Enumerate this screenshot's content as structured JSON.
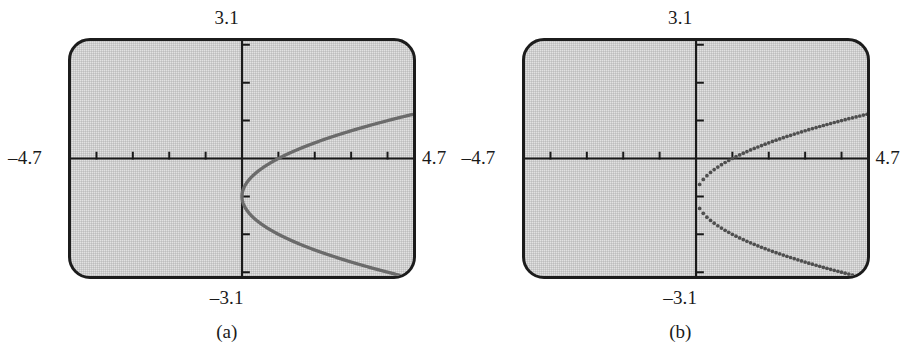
{
  "figure": {
    "panels": [
      {
        "caption": "(a)",
        "mode": "connected",
        "labels": {
          "ymax": "3.1",
          "ymin": "–3.1",
          "xmin": "–4.7",
          "xmax": "4.7"
        }
      },
      {
        "caption": "(b)",
        "mode": "dot",
        "labels": {
          "ymax": "3.1",
          "ymin": "–3.1",
          "xmin": "–4.7",
          "xmax": "4.7"
        }
      }
    ]
  },
  "colors": {
    "bezel": "#1c1c1c",
    "screen_fill": "#e2e2e2",
    "axis": "#1a1a1a",
    "curve": "#6b6b6b",
    "text": "#1a1a1a"
  },
  "chart_data": [
    {
      "type": "line",
      "title": "(a)",
      "xlabel": "",
      "ylabel": "",
      "xlim": [
        -4.7,
        4.7
      ],
      "ylim": [
        -3.1,
        3.1
      ],
      "grid": false,
      "legend": null,
      "axis_ticks": {
        "x_tick_values": [
          -4,
          -3,
          -2,
          -1,
          1,
          2,
          3,
          4
        ],
        "y_tick_values": [
          -3,
          -2,
          -1,
          1,
          2,
          3
        ],
        "x_tick_labels_shown": false,
        "y_tick_labels_shown": false
      },
      "annotations": [
        {
          "text": "3.1",
          "position": "above-screen-center"
        },
        {
          "text": "–3.1",
          "position": "below-screen-center"
        },
        {
          "text": "–4.7",
          "position": "left-of-screen-middle"
        },
        {
          "text": "4.7",
          "position": "right-of-screen-middle"
        }
      ],
      "description": "Sideways parabola x = (y+1)^2 - 0.02 drawn in connected line mode, vertex near (0, -1), opening to the right.",
      "series": [
        {
          "name": "upper branch",
          "x": [
            0.0,
            0.05,
            0.2,
            0.45,
            0.8,
            1.25,
            1.8,
            2.45,
            3.2,
            4.05,
            4.5
          ],
          "y": [
            -1.0,
            -0.78,
            -0.55,
            -0.33,
            -0.11,
            0.12,
            0.34,
            0.57,
            0.79,
            1.01,
            1.12
          ]
        },
        {
          "name": "lower branch",
          "x": [
            0.0,
            0.05,
            0.2,
            0.45,
            0.8,
            1.25,
            1.8,
            2.45,
            3.2,
            4.05,
            4.5
          ],
          "y": [
            -1.0,
            -1.22,
            -1.45,
            -1.67,
            -1.89,
            -2.12,
            -2.34,
            -2.57,
            -2.79,
            -3.01,
            -3.12
          ]
        }
      ]
    },
    {
      "type": "scatter",
      "title": "(b)",
      "xlabel": "",
      "ylabel": "",
      "xlim": [
        -4.7,
        4.7
      ],
      "ylim": [
        -3.1,
        3.1
      ],
      "grid": false,
      "legend": null,
      "axis_ticks": {
        "x_tick_values": [
          -4,
          -3,
          -2,
          -1,
          1,
          2,
          3,
          4
        ],
        "y_tick_values": [
          -3,
          -2,
          -1,
          1,
          2,
          3
        ],
        "x_tick_labels_shown": false,
        "y_tick_labels_shown": false
      },
      "annotations": [
        {
          "text": "3.1",
          "position": "above-screen-center"
        },
        {
          "text": "–3.1",
          "position": "below-screen-center"
        },
        {
          "text": "–4.7",
          "position": "left-of-screen-middle"
        },
        {
          "text": "4.7",
          "position": "right-of-screen-middle"
        }
      ],
      "description": "Same sideways parabola plotted in dot mode, showing discrete plotted points that become widely spaced far from the vertex.",
      "series": [
        {
          "name": "upper branch dots",
          "x": [
            0.0,
            0.02,
            0.09,
            0.2,
            0.36,
            0.56,
            0.81,
            1.1,
            1.44,
            1.82,
            2.25,
            2.72,
            3.24,
            3.8,
            4.41
          ],
          "y": [
            -1.0,
            -0.85,
            -0.7,
            -0.55,
            -0.4,
            -0.25,
            -0.1,
            0.05,
            0.2,
            0.35,
            0.5,
            0.65,
            0.8,
            0.95,
            1.1
          ]
        },
        {
          "name": "lower branch dots",
          "x": [
            0.0,
            0.02,
            0.09,
            0.2,
            0.36,
            0.56,
            0.81,
            1.1,
            1.44,
            1.82,
            2.25,
            2.72,
            3.24,
            3.8,
            4.41
          ],
          "y": [
            -1.0,
            -1.15,
            -1.3,
            -1.45,
            -1.6,
            -1.75,
            -1.9,
            -2.05,
            -2.2,
            -2.35,
            -2.5,
            -2.65,
            -2.8,
            -2.95,
            -3.1
          ]
        }
      ]
    }
  ]
}
